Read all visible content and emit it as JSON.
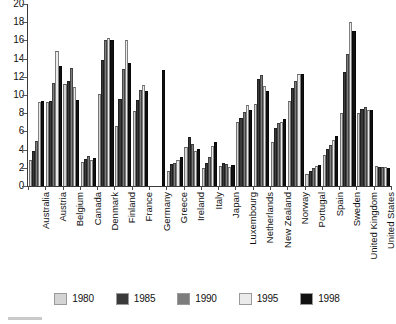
{
  "chart_data": {
    "type": "bar",
    "title": "",
    "subtitle": "",
    "xlabel": "",
    "ylabel": "",
    "ylim": [
      0,
      20
    ],
    "ytick_step": 2,
    "ytick_labels": [
      "20",
      "18",
      "16",
      "14",
      "12",
      "10",
      "8",
      "6",
      "4",
      "2",
      "0"
    ],
    "grid": false,
    "legend_position": "bottom",
    "categories": [
      "Australia",
      "Austria",
      "Belgium",
      "Canada",
      "Denmark",
      "Finland",
      "France",
      "Germany",
      "Greece",
      "Ireland",
      "Italy",
      "Japan",
      "Luxembourg",
      "Netherlands",
      "New Zealand",
      "Norway",
      "Portugal",
      "Spain",
      "Sweden",
      "United Kingdom",
      "United States"
    ],
    "series": [
      {
        "name": "1980",
        "color": "#d4d4d4",
        "values": [
          2.9,
          9.2,
          11.2,
          2.6,
          10.1,
          6.6,
          8.2,
          null,
          1.7,
          4.3,
          2.0,
          2.2,
          7.0,
          9.0,
          4.8,
          9.3,
          1.3,
          3.4,
          8.0,
          8.0,
          2.2
        ]
      },
      {
        "name": "1985",
        "color": "#3a3a3a",
        "values": [
          3.8,
          9.3,
          11.5,
          3.0,
          13.8,
          9.6,
          9.5,
          null,
          2.4,
          5.4,
          2.5,
          2.5,
          7.5,
          11.8,
          6.4,
          10.8,
          1.7,
          4.1,
          12.5,
          8.5,
          2.1
        ]
      },
      {
        "name": "1990",
        "color": "#7d7d7d",
        "values": [
          5.0,
          11.3,
          13.0,
          3.3,
          16.0,
          12.9,
          10.6,
          null,
          2.5,
          4.6,
          3.2,
          2.4,
          8.1,
          12.2,
          6.9,
          11.5,
          2.0,
          4.5,
          14.5,
          8.7,
          2.1
        ]
      },
      {
        "name": "1995",
        "color": "#ebebeb",
        "values": [
          9.2,
          14.8,
          10.9,
          2.9,
          16.3,
          16.0,
          11.1,
          null,
          2.9,
          3.9,
          4.4,
          2.1,
          8.9,
          11.0,
          7.0,
          12.3,
          2.2,
          5.1,
          18.0,
          8.3,
          2.1
        ]
      },
      {
        "name": "1998",
        "color": "#111111",
        "values": [
          9.3,
          13.2,
          9.4,
          3.1,
          16.1,
          13.5,
          10.4,
          12.8,
          3.2,
          4.1,
          4.8,
          2.3,
          8.4,
          10.4,
          7.4,
          12.3,
          2.3,
          5.5,
          17.0,
          8.4,
          2.0
        ]
      }
    ]
  },
  "legend": {
    "items": [
      {
        "label": "1980",
        "color": "#d4d4d4"
      },
      {
        "label": "1985",
        "color": "#3a3a3a"
      },
      {
        "label": "1990",
        "color": "#7d7d7d"
      },
      {
        "label": "1995",
        "color": "#ebebeb"
      },
      {
        "label": "1998",
        "color": "#111111"
      }
    ]
  }
}
